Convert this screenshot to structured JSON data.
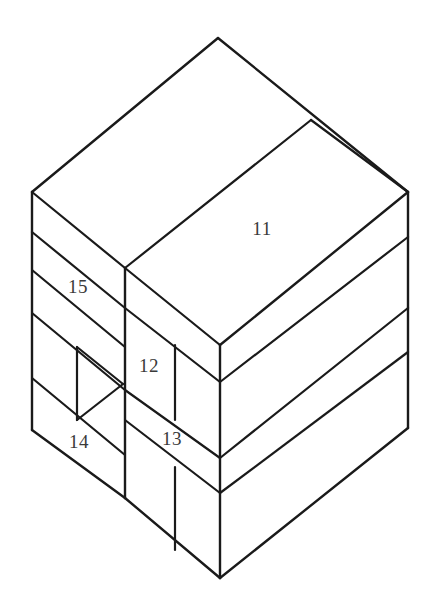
{
  "figure": {
    "type": "technical-line-drawing",
    "background_color": "#ffffff",
    "line_color": "#1a1a1a",
    "label_color": "#3a3a3a",
    "canvas": {
      "width": 435,
      "height": 612
    }
  },
  "labels": [
    {
      "id": "label-11",
      "text": "11",
      "x": 262,
      "y": 231,
      "target": "right-face-top-band"
    },
    {
      "id": "label-15",
      "text": "15",
      "x": 78,
      "y": 289,
      "target": "left-face-band-2"
    },
    {
      "id": "label-12",
      "text": "12",
      "x": 149,
      "y": 368,
      "target": "front-step-face-upper"
    },
    {
      "id": "label-14",
      "text": "14",
      "x": 79,
      "y": 444,
      "target": "left-face-band-4"
    },
    {
      "id": "label-13",
      "text": "13",
      "x": 172,
      "y": 441,
      "target": "front-step-face-lower"
    }
  ],
  "geometry": {
    "vertices": {
      "top_apex": [
        218,
        38
      ],
      "left_corner": [
        32,
        192
      ],
      "right_corner": [
        408,
        192
      ],
      "step_top": [
        125,
        268
      ],
      "front_corner": [
        220,
        345
      ],
      "left_bottom": [
        32,
        430
      ],
      "right_bottom": [
        408,
        428
      ],
      "front_bottom": [
        220,
        578
      ]
    },
    "left_face_band_edges_y": [
      192,
      232,
      270,
      313,
      378,
      430
    ],
    "right_face_band_edges_y": [
      192,
      237,
      308,
      352,
      428
    ],
    "front_edge_notch_y": [
      345,
      382,
      458,
      493,
      578
    ],
    "inner_vertical_left": {
      "x": 77,
      "y1": 347,
      "y2": 420
    },
    "inner_vertical_mid_upper": {
      "x": 175,
      "y1": 345,
      "y2": 420
    },
    "inner_vertical_mid_lower": {
      "x": 175,
      "y1": 467,
      "y2": 550
    },
    "step_vertical": {
      "x": 125,
      "y1": 268,
      "y2": 498
    }
  }
}
